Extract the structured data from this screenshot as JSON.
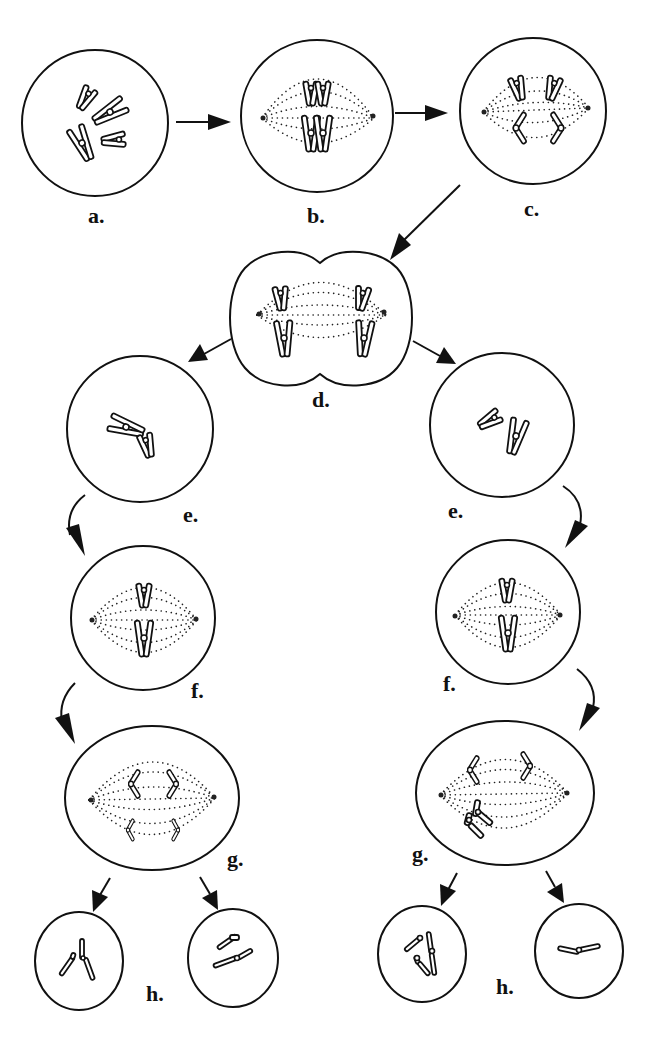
{
  "figure": {
    "colors": {
      "line": "#111111",
      "background": "#ffffff"
    }
  },
  "labels": {
    "a": "a.",
    "b": "b.",
    "c": "c.",
    "d": "d.",
    "e_left": "e.",
    "e_right": "e.",
    "f_left": "f.",
    "f_right": "f.",
    "g_left": "g.",
    "g_right": "g.",
    "h_left": "h.",
    "h_right": "h."
  },
  "stages": [
    {
      "id": "a",
      "description": "Cell with four replicated chromosomes"
    },
    {
      "id": "b",
      "description": "Homologous pairs aligned on spindle"
    },
    {
      "id": "c",
      "description": "Homologs separating toward poles"
    },
    {
      "id": "d",
      "description": "Dividing cell, chromosomes at both poles"
    },
    {
      "id": "e",
      "description": "Two daughter cells, two chromosomes each"
    },
    {
      "id": "f",
      "description": "Chromosomes aligned on spindle in each cell"
    },
    {
      "id": "g",
      "description": "Sister chromatids separating; right cell shows unequal separation"
    },
    {
      "id": "h",
      "description": "Four resulting gametes with differing chromosome numbers"
    }
  ]
}
